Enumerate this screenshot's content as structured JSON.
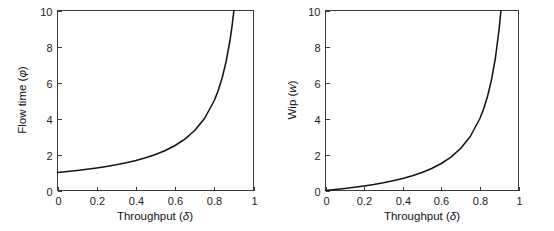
{
  "figure": {
    "background_color": "#ffffff",
    "curve_color": "#141414",
    "axis_color": "#3a3a3a",
    "panel_count": 2
  },
  "chart_data": [
    {
      "type": "line",
      "panel": "left",
      "title": "",
      "xlabel": "Throughput (δ)",
      "ylabel": "Flow time (φ)",
      "xlabel_text": "Throughput",
      "xlabel_symbol": "δ",
      "ylabel_text": "Flow time",
      "ylabel_symbol": "φ",
      "xlim": [
        0,
        1
      ],
      "ylim": [
        0,
        10
      ],
      "xticks": [
        0,
        0.2,
        0.4,
        0.6,
        0.8,
        1
      ],
      "xticklabels": [
        "0",
        "0.2",
        "0.4",
        "0.6",
        "0.8",
        "1"
      ],
      "yticks": [
        0,
        2,
        4,
        6,
        8,
        10
      ],
      "yticklabels": [
        "0",
        "2",
        "4",
        "6",
        "8",
        "10"
      ],
      "grid": false,
      "legend": false,
      "formula": "phi = 1/(1-delta)",
      "x": [
        0,
        0.05,
        0.1,
        0.15,
        0.2,
        0.25,
        0.3,
        0.35,
        0.4,
        0.45,
        0.5,
        0.55,
        0.6,
        0.65,
        0.7,
        0.75,
        0.8,
        0.82,
        0.84,
        0.86,
        0.88,
        0.89,
        0.9
      ],
      "values": [
        1,
        1.053,
        1.111,
        1.176,
        1.25,
        1.333,
        1.429,
        1.538,
        1.667,
        1.818,
        2,
        2.222,
        2.5,
        2.857,
        3.333,
        4,
        5,
        5.556,
        6.25,
        7.143,
        8.333,
        9.091,
        10
      ]
    },
    {
      "type": "line",
      "panel": "right",
      "title": "",
      "xlabel": "Throughput (δ)",
      "ylabel": "Wip (w)",
      "xlabel_text": "Throughput",
      "xlabel_symbol": "δ",
      "ylabel_text": "Wip",
      "ylabel_symbol": "w",
      "xlim": [
        0,
        1
      ],
      "ylim": [
        0,
        10
      ],
      "xticks": [
        0,
        0.2,
        0.4,
        0.6,
        0.8,
        1
      ],
      "xticklabels": [
        "0",
        "0.2",
        "0.4",
        "0.6",
        "0.8",
        "1"
      ],
      "yticks": [
        0,
        2,
        4,
        6,
        8,
        10
      ],
      "yticklabels": [
        "0",
        "2",
        "4",
        "6",
        "8",
        "10"
      ],
      "grid": false,
      "legend": false,
      "formula": "w = delta/(1-delta)",
      "x": [
        0,
        0.05,
        0.1,
        0.15,
        0.2,
        0.25,
        0.3,
        0.35,
        0.4,
        0.45,
        0.5,
        0.55,
        0.6,
        0.65,
        0.7,
        0.75,
        0.8,
        0.82,
        0.84,
        0.86,
        0.88,
        0.9,
        0.909
      ],
      "values": [
        0,
        0.053,
        0.111,
        0.176,
        0.25,
        0.333,
        0.429,
        0.538,
        0.667,
        0.818,
        1,
        1.222,
        1.5,
        1.857,
        2.333,
        3,
        4,
        4.556,
        5.25,
        6.143,
        7.333,
        9,
        10
      ]
    }
  ]
}
